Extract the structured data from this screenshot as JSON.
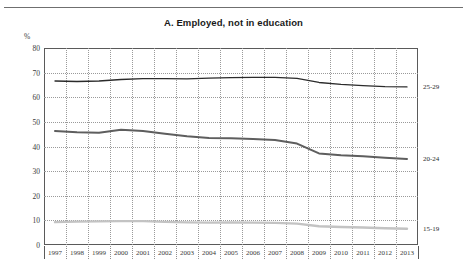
{
  "page": {
    "clipped_header": "",
    "title": "A. Employed, not in education"
  },
  "axes": {
    "unit": "%",
    "y_ticks": [
      "80",
      "70",
      "60",
      "50",
      "40",
      "30",
      "20",
      "10",
      "0"
    ],
    "x_ticks": [
      "1997",
      "1998",
      "1999",
      "2000",
      "2001",
      "2002",
      "2003",
      "2004",
      "2005",
      "2006",
      "2007",
      "2008",
      "2009",
      "2010",
      "2011",
      "2012",
      "2013"
    ]
  },
  "series_labels": {
    "s25_29": "25-29",
    "s20_24": "20-24",
    "s15_19": "15-19"
  },
  "chart_data": {
    "type": "line",
    "title": "A. Employed, not in education",
    "xlabel": "",
    "ylabel": "%",
    "ylim": [
      0,
      80
    ],
    "yticks": [
      0,
      10,
      20,
      30,
      40,
      50,
      60,
      70,
      80
    ],
    "grid": true,
    "legend": "right-inline-labels",
    "x": [
      1997,
      1998,
      1999,
      2000,
      2001,
      2002,
      2003,
      2004,
      2005,
      2006,
      2007,
      2008,
      2009,
      2010,
      2011,
      2012,
      2013
    ],
    "series": [
      {
        "name": "25-29",
        "color": "#2b2b2b",
        "values": [
          66.6,
          66.4,
          66.6,
          67.2,
          67.6,
          67.6,
          67.5,
          67.8,
          68.0,
          68.1,
          68.1,
          67.7,
          66.0,
          65.2,
          64.7,
          64.3,
          64.2
        ]
      },
      {
        "name": "20-24",
        "color": "#5e5e5e",
        "values": [
          46.3,
          45.8,
          45.6,
          46.8,
          46.3,
          45.2,
          44.2,
          43.5,
          43.3,
          43.0,
          42.6,
          41.2,
          37.2,
          36.4,
          36.0,
          35.4,
          34.9
        ]
      },
      {
        "name": "15-19",
        "color": "#c3c3c3",
        "values": [
          9.3,
          9.5,
          9.6,
          9.7,
          9.7,
          9.4,
          9.2,
          9.1,
          9.2,
          9.1,
          9.0,
          8.7,
          7.6,
          7.3,
          7.1,
          6.8,
          6.6
        ]
      }
    ]
  }
}
